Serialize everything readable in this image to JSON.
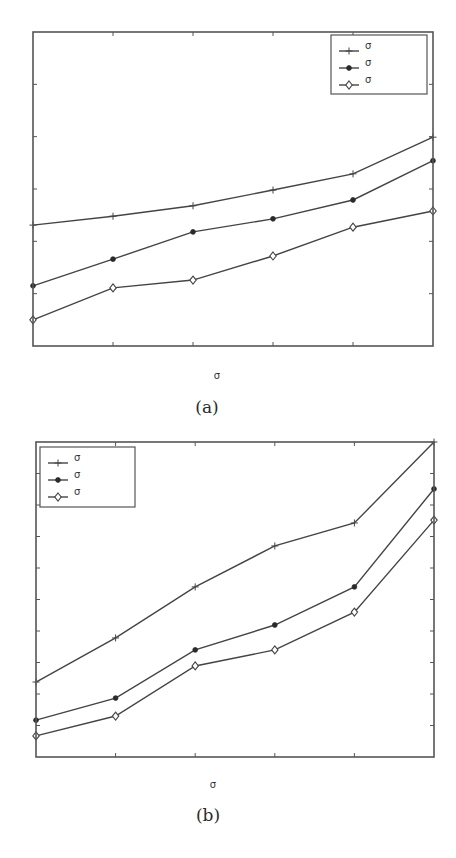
{
  "chart_data": [
    {
      "type": "line",
      "panel": "a",
      "caption": "(a)",
      "title": "",
      "xlabel": "σ",
      "ylabel": "",
      "x": [
        0,
        1,
        2,
        3,
        4,
        5
      ],
      "xlim": [
        0,
        5
      ],
      "ylim": [
        0,
        6
      ],
      "x_ticks_count": 6,
      "y_ticks_count": 7,
      "tick_labels_visible": false,
      "grid": false,
      "legend_position": "upper right",
      "series": [
        {
          "name": "σ",
          "marker": "plus",
          "values": [
            2.31,
            2.48,
            2.68,
            2.98,
            3.29,
            3.99
          ]
        },
        {
          "name": "σ",
          "marker": "dot",
          "values": [
            1.15,
            1.66,
            2.18,
            2.43,
            2.79,
            3.54
          ]
        },
        {
          "name": "σ",
          "marker": "diamond",
          "values": [
            0.5,
            1.11,
            1.26,
            1.72,
            2.27,
            2.58
          ]
        }
      ]
    },
    {
      "type": "line",
      "panel": "b",
      "caption": "(b)",
      "title": "",
      "xlabel": "σ",
      "ylabel": "",
      "x": [
        0,
        1,
        2,
        3,
        4,
        5
      ],
      "xlim": [
        0,
        5
      ],
      "ylim": [
        0,
        10
      ],
      "x_ticks_count": 6,
      "y_ticks_count": 11,
      "tick_labels_visible": false,
      "grid": false,
      "legend_position": "upper left",
      "series": [
        {
          "name": "σ",
          "marker": "plus",
          "values": [
            2.38,
            3.78,
            5.4,
            6.7,
            7.43,
            10.0
          ]
        },
        {
          "name": "σ",
          "marker": "dot",
          "values": [
            1.17,
            1.87,
            3.4,
            4.19,
            5.4,
            8.51
          ]
        },
        {
          "name": "σ",
          "marker": "diamond",
          "values": [
            0.67,
            1.3,
            2.89,
            3.4,
            4.6,
            7.52
          ]
        }
      ]
    }
  ],
  "colors": {
    "line": "#444444",
    "frame": "#555555",
    "background": "#ffffff"
  },
  "layout": [
    {
      "plot": {
        "left": 33,
        "top": 32,
        "right": 433,
        "bottom": 346
      },
      "legend": {
        "left": 331,
        "top": 35,
        "width": 96,
        "height": 59
      },
      "xlabel_pos": {
        "x": 217,
        "y": 370
      },
      "caption_pos": {
        "x": 207,
        "y": 397
      }
    },
    {
      "plot": {
        "left": 36,
        "top": 442,
        "right": 434,
        "bottom": 757
      },
      "legend": {
        "left": 40,
        "top": 447,
        "width": 95,
        "height": 60
      },
      "xlabel_pos": {
        "x": 213,
        "y": 779
      },
      "caption_pos": {
        "x": 208,
        "y": 805
      }
    }
  ]
}
